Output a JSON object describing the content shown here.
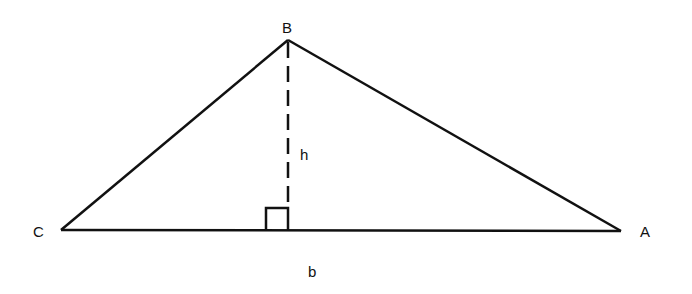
{
  "diagram": {
    "vertices": [
      {
        "name": "B",
        "x": 288,
        "y": 40
      },
      {
        "name": "C",
        "x": 61,
        "y": 230
      },
      {
        "name": "A",
        "x": 621,
        "y": 231
      }
    ],
    "labels": {
      "B": "B",
      "C": "C",
      "A": "A",
      "h": "h",
      "b": "b"
    },
    "height_foot": {
      "x": 288,
      "y": 230
    },
    "right_angle_marker_size": 22,
    "stroke_color": "#111111",
    "background": "#ffffff"
  }
}
